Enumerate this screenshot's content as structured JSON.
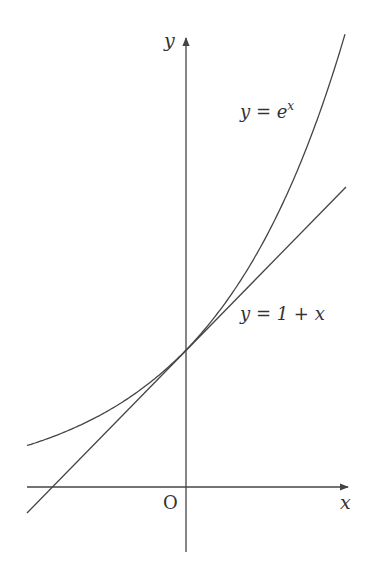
{
  "diagram": {
    "axes": {
      "x_label": "x",
      "y_label": "y",
      "origin_label": "O"
    },
    "curves": [
      {
        "name": "exponential",
        "label_lhs": "y = e",
        "label_sup": "x",
        "expression": "e^x"
      },
      {
        "name": "tangent-line",
        "label": "y = 1 + x",
        "expression": "1 + x"
      }
    ],
    "tangent_point": {
      "x": 0,
      "y": 1
    },
    "colors": {
      "stroke": "#444444",
      "text": "#333333",
      "background": "#ffffff"
    }
  }
}
